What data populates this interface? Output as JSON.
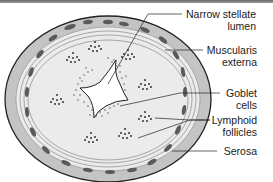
{
  "labels": {
    "narrow_stellate_lumen": [
      "Narrow stellate",
      "lumen"
    ],
    "muscularis_externa": [
      "Muscularis",
      "externa"
    ],
    "goblet_cells": [
      "Goblet",
      "cells"
    ],
    "lymphoid_follicles": [
      "Lymphoid",
      "follicles"
    ],
    "serosa": [
      "Serosa"
    ]
  },
  "colors": {
    "outer_ring": "#bdbdbd",
    "inner_fill": "#eeeeee",
    "outline": "#222222",
    "muscle_bundle": "#555555",
    "dots": "#333333"
  }
}
